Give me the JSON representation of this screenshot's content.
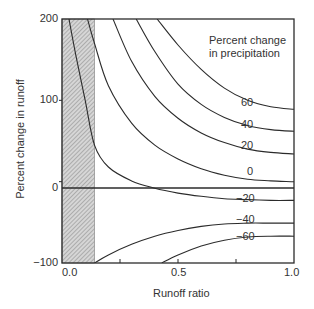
{
  "chart_data": {
    "type": "line",
    "title": "",
    "xlabel": "Runoff ratio",
    "ylabel": "Percent change in runoff",
    "xlim": [
      0.0,
      1.0
    ],
    "ylim": [
      -100,
      200
    ],
    "xticks": [
      "0.0",
      "0.5",
      "1.0"
    ],
    "xtick_minor": [
      0.25,
      0.75
    ],
    "yticks": [
      "-100",
      "0",
      "200"
    ],
    "ytick_minor": [
      100
    ],
    "ytick_labels": [
      "200",
      "100",
      "0",
      "−100"
    ],
    "grid": false,
    "legend_title": [
      "Percent change",
      "in precipitation"
    ],
    "hatched_region": {
      "x_from": 0.0,
      "x_to": 0.14
    },
    "reference_line": {
      "y": 0
    },
    "series": [
      {
        "name": "60",
        "x": [
          0.41,
          0.5,
          0.6,
          0.7,
          0.8,
          0.9,
          1.0
        ],
        "y": [
          200,
          168,
          138,
          115,
          100,
          92,
          89
        ]
      },
      {
        "name": "40",
        "x": [
          0.32,
          0.4,
          0.5,
          0.6,
          0.7,
          0.8,
          0.9,
          1.0
        ],
        "y": [
          200,
          160,
          120,
          95,
          79,
          69,
          64,
          62
        ]
      },
      {
        "name": "20",
        "x": [
          0.22,
          0.3,
          0.4,
          0.5,
          0.6,
          0.7,
          0.8,
          0.9,
          1.0
        ],
        "y": [
          200,
          148,
          105,
          78,
          60,
          48,
          40,
          36,
          34
        ]
      },
      {
        "name": "0",
        "x": [
          0.11,
          0.14,
          0.2,
          0.3,
          0.4,
          0.5,
          0.6,
          0.7,
          0.8,
          0.9,
          1.0
        ],
        "y": [
          200,
          170,
          118,
          72,
          45,
          28,
          16,
          8,
          3,
          1,
          0
        ]
      },
      {
        "name": "-20",
        "x": [
          0.03,
          0.06,
          0.1,
          0.14,
          0.2,
          0.3,
          0.4,
          0.5,
          0.6,
          0.7,
          0.8,
          0.9,
          1.0
        ],
        "y": [
          200,
          155,
          100,
          45,
          18,
          1,
          -8,
          -14,
          -18,
          -21,
          -22,
          -23,
          -23
        ]
      },
      {
        "name": "-40",
        "x": [
          0.14,
          0.2,
          0.3,
          0.4,
          0.5,
          0.6,
          0.7,
          0.8,
          0.9,
          1.0
        ],
        "y": [
          -100,
          -90,
          -77,
          -67,
          -60,
          -55,
          -52,
          -51,
          -51,
          -51
        ]
      },
      {
        "name": "-60",
        "x": [
          0.43,
          0.5,
          0.6,
          0.7,
          0.8,
          0.9,
          1.0
        ],
        "y": [
          -100,
          -90,
          -79,
          -72,
          -68,
          -67,
          -67
        ]
      }
    ],
    "curve_labels": [
      {
        "text": "60",
        "x": 0.76,
        "y": 84
      },
      {
        "text": "40",
        "x": 0.76,
        "y": 57
      },
      {
        "text": "20",
        "x": 0.76,
        "y": 31
      },
      {
        "text": "0",
        "x": 0.8,
        "y": 6
      },
      {
        "text": "−20",
        "x": 0.75,
        "y": -11
      },
      {
        "text": "−40",
        "x": 0.75,
        "y": -37
      },
      {
        "text": "−60",
        "x": 0.75,
        "y": -58
      }
    ]
  },
  "axes": {
    "x_ticks": [
      {
        "label": "0.0",
        "value": 0.0
      },
      {
        "label": "0.5",
        "value": 0.5
      },
      {
        "label": "1.0",
        "value": 1.0
      }
    ],
    "y_ticks": [
      {
        "label": "200",
        "value": 200
      },
      {
        "label": "100",
        "value": 100
      },
      {
        "label": "0",
        "value": 0
      },
      {
        "label": "−100",
        "value": -100
      }
    ],
    "xlabel": "Runoff ratio",
    "ylabel": "Percent change in runoff"
  },
  "legend": {
    "line1": "Percent change",
    "line2": "in precipitation"
  },
  "labels": {
    "p60": "60",
    "p40": "40",
    "p20": "20",
    "p0": "0",
    "m20": "−20",
    "m40": "−40",
    "m60": "−60"
  },
  "colors": {
    "line": "#2b2b2b",
    "hatch_bg": "#d4d4d4",
    "hatch_line": "#7a7a7a"
  }
}
